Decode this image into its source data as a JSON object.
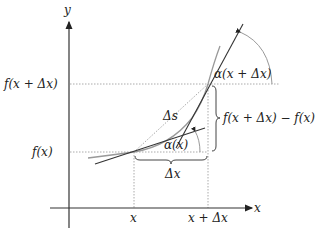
{
  "axes": {
    "x_label": "x",
    "y_label": "y"
  },
  "ticks": {
    "x1": "x",
    "x2": "x + Δx",
    "y1": "f(x)",
    "y2": "f(x + Δx)"
  },
  "annotations": {
    "delta_s": "Δs",
    "delta_x": "Δx",
    "delta_f": "f(x + Δx) − f(x)",
    "alpha_x": "α(x)",
    "alpha_x_dx": "α(x + Δx)"
  },
  "colors": {
    "axis": "#333333",
    "curve": "#9a9a9a",
    "tangent": "#333333",
    "dotted": "#aaaaaa"
  }
}
